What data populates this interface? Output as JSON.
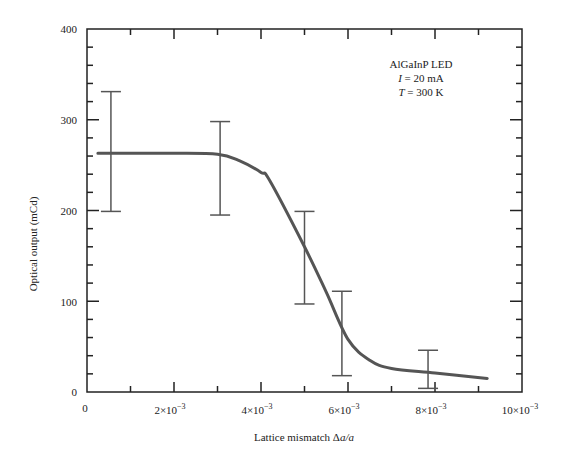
{
  "chart_data": {
    "type": "line",
    "title": "",
    "xlabel": "Lattice mismatch Δa/a",
    "ylabel": "Optical output (mCd)",
    "xlim": [
      0,
      0.01
    ],
    "ylim": [
      0,
      400
    ],
    "grid": false,
    "x_ticks": [
      0,
      0.002,
      0.004,
      0.006,
      0.008,
      0.01
    ],
    "x_tick_labels": [
      "0",
      "2×10⁻³",
      "4×10⁻³",
      "6×10⁻³",
      "8×10⁻³",
      "10×10⁻³"
    ],
    "y_ticks": [
      0,
      100,
      200,
      300,
      400
    ],
    "y_tick_labels": [
      "0",
      "100",
      "200",
      "300",
      "400"
    ],
    "annotation": {
      "lines": [
        "AlGaInP LED",
        "I = 20 mA",
        "T = 300 K"
      ]
    },
    "series": [
      {
        "name": "fit curve",
        "kind": "line",
        "x": [
          0.00025,
          0.001,
          0.002,
          0.003,
          0.0035,
          0.004,
          0.0042,
          0.005,
          0.0055,
          0.006,
          0.0065,
          0.007,
          0.008,
          0.0092
        ],
        "y": [
          263,
          263,
          263,
          262,
          255,
          242,
          233,
          160,
          110,
          58,
          35,
          26,
          21,
          15
        ]
      },
      {
        "name": "measured (error bars)",
        "kind": "errorbar",
        "x": [
          0.00055,
          0.00306,
          0.005,
          0.00586,
          0.00784
        ],
        "y_low": [
          199,
          195,
          97,
          18,
          4
        ],
        "y_high": [
          331,
          298,
          199,
          111,
          46
        ]
      }
    ]
  },
  "labels": {
    "y0": "0",
    "y100": "100",
    "y200": "200",
    "y300": "300",
    "y400": "400",
    "x0": "0",
    "x2_mant": "2×10",
    "x4_mant": "4×10",
    "x6_mant": "6×10",
    "x8_mant": "8×10",
    "x10_mant": "10×10",
    "exp": "−3",
    "xlabel_text": "Lattice mismatch Δ",
    "xlabel_ital": "a/a",
    "ylabel": "Optical output (mCd)",
    "annot1": "AlGaInP LED",
    "annot2_var": "I",
    "annot2_val": " = 20 mA",
    "annot3_var": "T",
    "annot3_val": " = 300 K"
  },
  "colors": {
    "axis": "#222222",
    "curve": "#555555",
    "errorbar": "#555555"
  }
}
